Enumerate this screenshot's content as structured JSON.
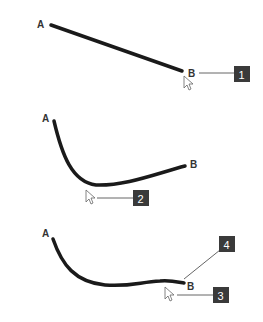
{
  "panels": [
    {
      "id": 1,
      "start_label": "A",
      "end_label": "B",
      "callouts": [
        "1"
      ],
      "shape": "straight line"
    },
    {
      "id": 2,
      "start_label": "A",
      "end_label": "B",
      "callouts": [
        "2"
      ],
      "shape": "curve dragged downward"
    },
    {
      "id": 3,
      "start_label": "A",
      "end_label": "B",
      "callouts": [
        "4",
        "3"
      ],
      "shape": "curve with end adjusted"
    }
  ],
  "colors": {
    "stroke": "#1a1a1a",
    "callout_box": "#3a3a3a",
    "leader": "#666666",
    "text": "#333333"
  }
}
